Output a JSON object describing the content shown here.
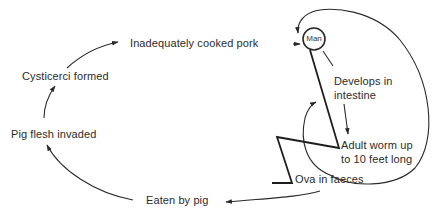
{
  "diagram": {
    "nodes": {
      "man": "Man",
      "inadequately_cooked_pork": "Inadequately cooked pork",
      "cysticerci_formed": "Cysticerci formed",
      "pig_flesh_invaded": "Pig flesh invaded",
      "eaten_by_pig": "Eaten by pig",
      "ova_in_faeces": "Ova in faeces",
      "develops_line1": "Develops in",
      "develops_line2": "intestine",
      "adult_line1": "Adult worm up",
      "adult_line2": "to 10 feet long"
    },
    "flow": [
      "Inadequately cooked pork",
      "Man",
      "Develops in intestine",
      "Adult worm up to 10 feet long",
      "Ova in faeces",
      "Eaten by pig",
      "Pig flesh invaded",
      "Cysticerci formed",
      "Inadequately cooked pork"
    ],
    "colors": {
      "ink": "#2a2a2a",
      "background": "#ffffff"
    }
  }
}
